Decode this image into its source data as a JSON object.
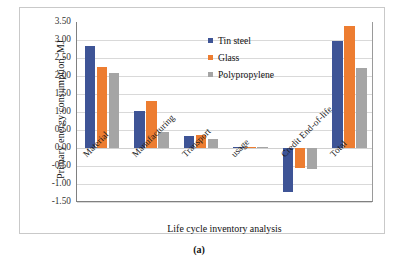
{
  "figure": {
    "caption": "(a)"
  },
  "chart_data": {
    "type": "bar",
    "title": "",
    "xlabel": "Life cycle inventory analysis",
    "ylabel": "Primary energy consumption, MJ",
    "categories": [
      "Material",
      "Manufacturing",
      "Transport",
      "usage",
      "Credit End-of-life",
      "Total"
    ],
    "series": [
      {
        "name": "Tin steel",
        "color": "#3e5496",
        "values": [
          2.83,
          1.02,
          0.34,
          0.03,
          -1.23,
          2.98
        ]
      },
      {
        "name": "Glass",
        "color": "#ed7d31",
        "values": [
          2.25,
          1.3,
          0.36,
          0.02,
          -0.56,
          3.4
        ]
      },
      {
        "name": "Polypropylene",
        "color": "#a5a5a5",
        "values": [
          2.08,
          0.44,
          0.24,
          0.02,
          -0.57,
          2.23
        ]
      }
    ],
    "ylim": [
      -1.5,
      3.5
    ],
    "ytick_step": 0.5,
    "ytick_labels": [
      "3.50",
      "3.00",
      "2.50",
      "2.00",
      "1.50",
      "1.00",
      "0.50",
      "0.00",
      "-0.50",
      "-1.00",
      "-1.50"
    ],
    "ytick_values": [
      3.5,
      3.0,
      2.5,
      2.0,
      1.5,
      1.0,
      0.5,
      0.0,
      -0.5,
      -1.0,
      -1.5
    ],
    "grid": true,
    "legend_position": "top-right",
    "category_label_rotation": -45
  }
}
